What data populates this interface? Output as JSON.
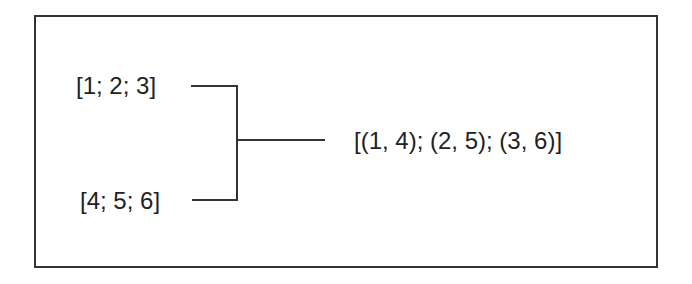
{
  "diagram": {
    "type": "zip-operation",
    "inputs": [
      {
        "label": "[1; 2; 3]"
      },
      {
        "label": "[4; 5; 6]"
      }
    ],
    "output": {
      "label": "[(1, 4); (2, 5); (3, 6)]"
    },
    "colors": {
      "line": "#333333",
      "text": "#222222",
      "background": "#ffffff"
    }
  }
}
